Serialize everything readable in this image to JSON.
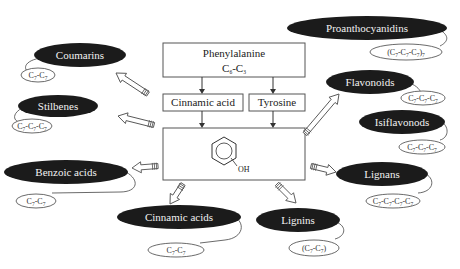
{
  "center": {
    "phenylalanine": "Phenylalanine",
    "phenylalanine_formula": {
      "c1": "C",
      "s1": "6",
      "dash": "-C",
      "s2": "3"
    },
    "cinnamic_acid": "Cinnamic acid",
    "tyrosine": "Tyrosine",
    "phenol_label": "OH"
  },
  "nodes": [
    {
      "id": "coumarins",
      "label": "Coumarins",
      "formula": [
        [
          "C",
          "7"
        ],
        [
          "C",
          "7"
        ]
      ],
      "bracketed": false
    },
    {
      "id": "stilbenes",
      "label": "Stilbenes",
      "formula": [
        [
          "C",
          "7"
        ],
        [
          "C",
          "7"
        ],
        [
          "C",
          "7"
        ]
      ],
      "bracketed": false
    },
    {
      "id": "benzoic-acids",
      "label": "Benzoic acids",
      "formula": [
        [
          "C",
          "7"
        ],
        [
          "C",
          "7"
        ]
      ],
      "bracketed": false
    },
    {
      "id": "cinnamic-acids",
      "label": "Cinnamic acids",
      "formula": [
        [
          "C",
          "7"
        ],
        [
          "C",
          "7"
        ]
      ],
      "bracketed": false
    },
    {
      "id": "lignins",
      "label": "Lignins",
      "formula": [
        [
          "C",
          "7"
        ],
        [
          "C",
          "7"
        ]
      ],
      "bracketed": true
    },
    {
      "id": "lignans",
      "label": "Lignans",
      "formula": [
        [
          "C",
          "7"
        ],
        [
          "C",
          "7"
        ],
        [
          "C",
          "7"
        ],
        [
          "C",
          "7"
        ]
      ],
      "bracketed": false
    },
    {
      "id": "isiflavonods",
      "label": "Isiflavonods",
      "formula": [
        [
          "C",
          "7"
        ],
        [
          "C",
          "7"
        ],
        [
          "C",
          "7"
        ]
      ],
      "bracketed": false
    },
    {
      "id": "flavonoids",
      "label": "Flavonoids",
      "formula": [
        [
          "C",
          "7"
        ],
        [
          "C",
          "7"
        ],
        [
          "C",
          "7"
        ]
      ],
      "bracketed": false
    },
    {
      "id": "proanthocyanidins",
      "label": "Proanthocyanidins",
      "formula": [
        [
          "C",
          "7"
        ],
        [
          "C",
          "7"
        ],
        [
          "C",
          "7"
        ]
      ],
      "bracketed": true,
      "suffix": "7"
    }
  ]
}
